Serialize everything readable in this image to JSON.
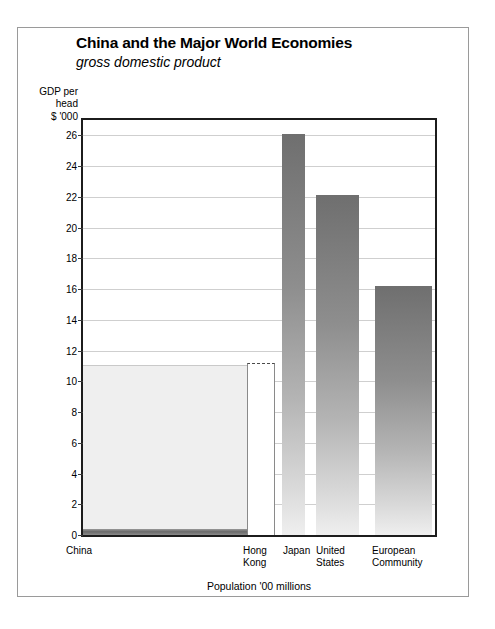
{
  "chart_data": {
    "type": "bar",
    "title": "China and the Major World Economies",
    "subtitle": "gross domestic product",
    "ylabel": "GDP per head $ '000",
    "ylabel_lines": [
      "GDP per",
      "head",
      "$ '000"
    ],
    "xlabel": "Population '00 millions",
    "categories": [
      "China",
      "Hong Kong",
      "Japan",
      "United States",
      "European Community"
    ],
    "values": [
      0.3,
      11.2,
      26.1,
      22.1,
      16.2
    ],
    "widths": [
      11.5,
      0.06,
      1.24,
      2.55,
      3.4
    ],
    "ylim": [
      0,
      27
    ],
    "yticks": [
      0,
      2,
      4,
      6,
      8,
      10,
      12,
      14,
      16,
      18,
      20,
      22,
      24,
      26
    ],
    "grid": true,
    "legend": false,
    "series": [
      {
        "name": "GDP per head $ '000",
        "points": [
          {
            "category": "China",
            "value": 0.3,
            "reference_level": 11.0,
            "style": "shaded-block-with-base-band"
          },
          {
            "category": "Hong Kong",
            "value": 11.2,
            "style": "outlined-dashed-top"
          },
          {
            "category": "Japan",
            "value": 26.1,
            "style": "gradient-fill"
          },
          {
            "category": "United States",
            "value": 22.1,
            "style": "gradient-fill"
          },
          {
            "category": "European Community",
            "value": 16.2,
            "style": "gradient-fill"
          }
        ]
      }
    ]
  },
  "x_axis_labels": [
    {
      "text": "China"
    },
    {
      "text": "Hong\nKong"
    },
    {
      "text": "Japan"
    },
    {
      "text": "United\nStates"
    },
    {
      "text": "European\nCommunity"
    }
  ],
  "colors": {
    "frame": "#1c1c1c",
    "gridline": "#cfcfcf",
    "bar_top": "#6f6f6f",
    "bar_bottom": "#efefef",
    "china_block": "#efefef",
    "card_border": "#9a9a9a",
    "background": "#ffffff"
  }
}
